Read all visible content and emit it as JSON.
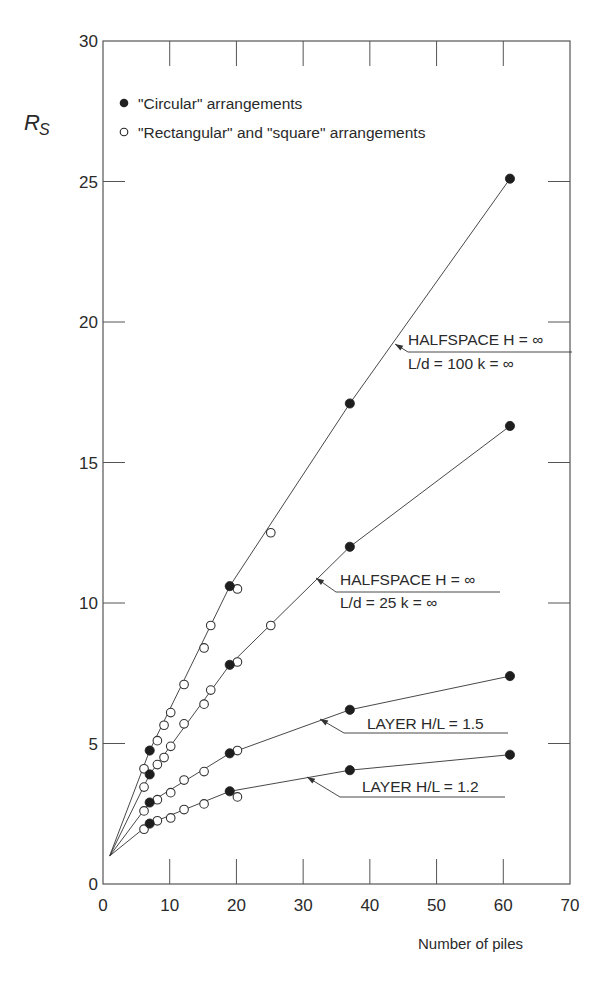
{
  "chart_data": {
    "type": "scatter",
    "title": "",
    "xlabel": "Number of piles",
    "ylabel": "R_s",
    "ylabel_main": "R",
    "ylabel_sub": "S",
    "xlim": [
      0,
      70
    ],
    "ylim": [
      0,
      30
    ],
    "xticks": [
      0,
      10,
      20,
      30,
      40,
      50,
      60,
      70
    ],
    "yticks": [
      0,
      5,
      10,
      15,
      20,
      25,
      30
    ],
    "grid": false,
    "legend_position": "upper-left (inside)",
    "legend": [
      {
        "marker": "filled-circle",
        "label": "\"Circular\" arrangements"
      },
      {
        "marker": "open-circle",
        "label": "\"Rectangular\" and \"square\" arrangements"
      }
    ],
    "origin_point": [
      1,
      1.0
    ],
    "series": [
      {
        "name": "HALFSPACE H = ∞, L/d = 100, k = ∞",
        "annotation_line1": "HALFSPACE H = ∞",
        "annotation_line2": "L/d = 100   k = ∞",
        "line": [
          [
            1,
            1.0
          ],
          [
            7,
            4.75
          ],
          [
            19,
            10.6
          ],
          [
            37,
            17.1
          ],
          [
            61,
            25.1
          ]
        ],
        "circular": [
          [
            7,
            4.75
          ],
          [
            19,
            10.6
          ],
          [
            37,
            17.1
          ],
          [
            61,
            25.1
          ]
        ],
        "rectangular": [
          [
            6,
            4.1
          ],
          [
            8,
            5.1
          ],
          [
            9,
            5.65
          ],
          [
            10,
            6.1
          ],
          [
            12,
            7.1
          ],
          [
            15,
            8.4
          ],
          [
            16,
            9.2
          ],
          [
            20,
            10.5
          ],
          [
            25,
            12.5
          ]
        ]
      },
      {
        "name": "HALFSPACE H = ∞, L/d = 25, k = ∞",
        "annotation_line1": "HALFSPACE H = ∞",
        "annotation_line2": "L/d = 25   k = ∞",
        "line": [
          [
            1,
            1.0
          ],
          [
            7,
            3.9
          ],
          [
            19,
            7.8
          ],
          [
            37,
            12.0
          ],
          [
            61,
            16.3
          ]
        ],
        "circular": [
          [
            7,
            3.9
          ],
          [
            19,
            7.8
          ],
          [
            37,
            12.0
          ],
          [
            61,
            16.3
          ]
        ],
        "rectangular": [
          [
            6,
            3.45
          ],
          [
            8,
            4.25
          ],
          [
            9,
            4.5
          ],
          [
            10,
            4.9
          ],
          [
            12,
            5.7
          ],
          [
            15,
            6.4
          ],
          [
            16,
            6.9
          ],
          [
            20,
            7.9
          ],
          [
            25,
            9.2
          ]
        ]
      },
      {
        "name": "LAYER H/L = 1.5",
        "annotation_line1": "LAYER H/L = 1.5",
        "line": [
          [
            1,
            1.0
          ],
          [
            7,
            2.9
          ],
          [
            19,
            4.65
          ],
          [
            37,
            6.2
          ],
          [
            61,
            7.4
          ]
        ],
        "circular": [
          [
            7,
            2.9
          ],
          [
            19,
            4.65
          ],
          [
            37,
            6.2
          ],
          [
            61,
            7.4
          ]
        ],
        "rectangular": [
          [
            6,
            2.6
          ],
          [
            8,
            3.0
          ],
          [
            10,
            3.25
          ],
          [
            12,
            3.7
          ],
          [
            15,
            4.0
          ],
          [
            20,
            4.75
          ]
        ]
      },
      {
        "name": "LAYER H/L = 1.2",
        "annotation_line1": "LAYER H/L = 1.2",
        "line": [
          [
            1,
            1.0
          ],
          [
            7,
            2.15
          ],
          [
            19,
            3.3
          ],
          [
            37,
            4.05
          ],
          [
            61,
            4.6
          ]
        ],
        "circular": [
          [
            7,
            2.15
          ],
          [
            19,
            3.3
          ],
          [
            37,
            4.05
          ],
          [
            61,
            4.6
          ]
        ],
        "rectangular": [
          [
            6,
            1.95
          ],
          [
            8,
            2.25
          ],
          [
            10,
            2.35
          ],
          [
            12,
            2.65
          ],
          [
            15,
            2.85
          ],
          [
            20,
            3.1
          ]
        ]
      }
    ]
  }
}
